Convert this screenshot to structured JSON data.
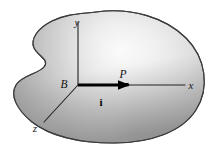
{
  "figure": {
    "background_color": "#ffffff",
    "body": {
      "name": "rigid-body-blob",
      "outline_color": "#3a3a3a",
      "fill_light": "#f2f2f2",
      "fill_mid": "#c9c9c9",
      "fill_dark": "#8e8e8e"
    },
    "axes": [
      {
        "id": "y",
        "label": "y",
        "label_x": 77,
        "label_y": 26,
        "x1": 78,
        "y1": 85,
        "x2": 78,
        "y2": 22
      },
      {
        "id": "x",
        "label": "x",
        "label_x": 191,
        "label_y": 89,
        "x1": 78,
        "y1": 85,
        "x2": 185,
        "y2": 85
      },
      {
        "id": "z",
        "label": "z",
        "label_x": 35,
        "label_y": 132,
        "x1": 78,
        "y1": 85,
        "x2": 44,
        "y2": 122
      }
    ],
    "points": [
      {
        "id": "B",
        "label": "B",
        "label_x": 64,
        "label_y": 88,
        "x": 78,
        "y": 85
      },
      {
        "id": "P",
        "label": "P",
        "label_x": 123,
        "label_y": 78,
        "x": 127,
        "y": 85
      }
    ],
    "vector": {
      "id": "i",
      "label": "i",
      "label_x": 101,
      "label_y": 106,
      "from_x": 78,
      "from_y": 85,
      "to_x": 128,
      "to_y": 85,
      "color": "#000000"
    }
  }
}
